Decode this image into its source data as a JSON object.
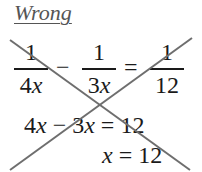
{
  "label": "Wrong",
  "equation1": {
    "frac1": {
      "num": "1",
      "den_coef": "4",
      "den_var": "x"
    },
    "op1": "−",
    "frac2": {
      "num": "1",
      "den_coef": "3",
      "den_var": "x"
    },
    "op2": "=",
    "frac3": {
      "num": "1",
      "den": "12"
    }
  },
  "equation2": {
    "lhs_a": "4",
    "var_a": "x",
    "op": "−",
    "lhs_b": "3",
    "var_b": "x",
    "eq": "=",
    "rhs": "12"
  },
  "equation3": {
    "var": "x",
    "eq": "=",
    "rhs": "12"
  },
  "cross_color": "#6e6e6e"
}
